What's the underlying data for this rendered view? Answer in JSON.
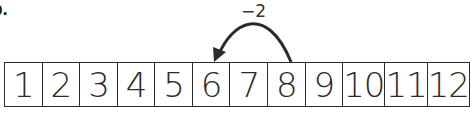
{
  "problem_label": "b.",
  "number_strip": {
    "cells": [
      "1",
      "2",
      "3",
      "4",
      "5",
      "6",
      "7",
      "8",
      "9",
      "10",
      "11",
      "12"
    ]
  },
  "jump": {
    "label": "−2",
    "from": 8,
    "to": 6,
    "direction": "left"
  },
  "colors": {
    "line": "#2b2b2b",
    "background": "#ffffff"
  }
}
